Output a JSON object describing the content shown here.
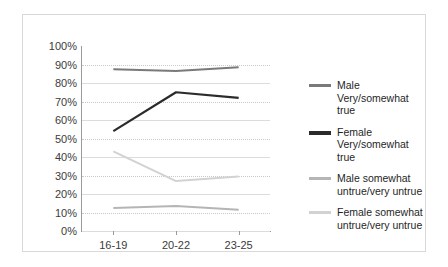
{
  "chart_data": {
    "type": "line",
    "title": "",
    "xlabel": "",
    "ylabel": "",
    "categories": [
      "16-19",
      "20-22",
      "23-25"
    ],
    "ylim": [
      0,
      100
    ],
    "ytick_labels": [
      "100%",
      "90%",
      "80%",
      "70%",
      "60%",
      "50%",
      "40%",
      "30%",
      "20%",
      "10%",
      "0%"
    ],
    "ytick_values": [
      100,
      90,
      80,
      70,
      60,
      50,
      40,
      30,
      20,
      10,
      0
    ],
    "grid": true,
    "legend_position": "right",
    "series": [
      {
        "name": "Male Very/somewhat true",
        "values": [
          87.5,
          86.5,
          88.5
        ],
        "color": "#7a7a7a"
      },
      {
        "name": "Female Very/somewhat true",
        "values": [
          54,
          75,
          72
        ],
        "color": "#2b2b2b"
      },
      {
        "name": "Male somewhat untrue/very untrue",
        "values": [
          12.5,
          13.5,
          11.5
        ],
        "color": "#b5b5b5"
      },
      {
        "name": "Female somewhat untrue/very untrue",
        "values": [
          43,
          27,
          29.5
        ],
        "color": "#d2d2d2"
      }
    ]
  },
  "legend": {
    "items": [
      {
        "label": "Male Very/somewhat true",
        "color": "#7a7a7a"
      },
      {
        "label": "Female Very/somewhat true",
        "color": "#2b2b2b"
      },
      {
        "label": "Male somewhat untrue/very untrue",
        "color": "#b5b5b5"
      },
      {
        "label": "Female somewhat untrue/very untrue",
        "color": "#d2d2d2"
      }
    ]
  },
  "axes": {
    "y_ticks": [
      "100%",
      "90%",
      "80%",
      "70%",
      "60%",
      "50%",
      "40%",
      "30%",
      "20%",
      "10%",
      "0%"
    ],
    "x_ticks": [
      "16-19",
      "20-22",
      "23-25"
    ]
  }
}
